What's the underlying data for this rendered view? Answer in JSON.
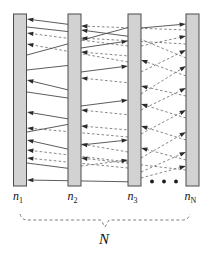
{
  "figure": {
    "background": "#ffffff",
    "bar_fill": "#d2d2d2",
    "bar_stroke": "#4a4a4a",
    "solid_link_color": "#4a4a4a",
    "dashed_link_color": "#6a6a6a",
    "arrow_color": "#2b2b2b",
    "brace_color": "#707070"
  },
  "nodes": [
    {
      "id": "n1",
      "label_base": "n",
      "label_sub": "1",
      "x": 13.5,
      "y": 14.0,
      "w": 13.0,
      "h": 172.0,
      "label_x": 13.0,
      "label_y": 200.0
    },
    {
      "id": "n2",
      "label_base": "n",
      "label_sub": "2",
      "x": 68.0,
      "y": 14.0,
      "w": 13.0,
      "h": 172.0,
      "label_x": 67.5,
      "label_y": 200.0
    },
    {
      "id": "n3",
      "label_base": "n",
      "label_sub": "3",
      "x": 128.0,
      "y": 14.0,
      "w": 13.0,
      "h": 172.0,
      "label_x": 127.5,
      "label_y": 200.0
    },
    {
      "id": "nN",
      "label_base": "n",
      "label_sub": "N",
      "x": 186.0,
      "y": 14.0,
      "w": 13.0,
      "h": 172.0,
      "label_x": 184.5,
      "label_y": 200.0
    }
  ],
  "ellipsis": {
    "name": "ellipsis-dots",
    "dots": [
      {
        "cx": 152.0,
        "cy": 181.5,
        "r": 1.9
      },
      {
        "cx": 164.0,
        "cy": 181.5,
        "r": 1.9
      },
      {
        "cx": 176.0,
        "cy": 181.5,
        "r": 1.9
      }
    ]
  },
  "links": [
    {
      "style": "solid",
      "x1": 81.0,
      "y1": 26.0,
      "x2": 27.0,
      "y2": 19.0,
      "dir": "left"
    },
    {
      "style": "solid",
      "x1": 27.0,
      "y1": 27.0,
      "x2": 81.0,
      "y2": 33.0,
      "dir": "right"
    },
    {
      "style": "dashed",
      "x1": 128.0,
      "y1": 46.0,
      "x2": 27.0,
      "y2": 33.0,
      "dir": "left"
    },
    {
      "style": "dashed",
      "x1": 128.0,
      "y1": 62.0,
      "x2": 27.0,
      "y2": 44.0,
      "dir": "left"
    },
    {
      "style": "solid",
      "x1": 81.0,
      "y1": 93.0,
      "x2": 27.0,
      "y2": 80.0,
      "dir": "left"
    },
    {
      "style": "solid",
      "x1": 27.0,
      "y1": 92.0,
      "x2": 81.0,
      "y2": 100.0,
      "dir": "right"
    },
    {
      "style": "solid",
      "x1": 81.0,
      "y1": 121.0,
      "x2": 27.0,
      "y2": 112.0,
      "dir": "left"
    },
    {
      "style": "dashed",
      "x1": 128.0,
      "y1": 137.0,
      "x2": 27.0,
      "y2": 128.0,
      "dir": "left"
    },
    {
      "style": "solid",
      "x1": 81.0,
      "y1": 152.0,
      "x2": 27.0,
      "y2": 140.0,
      "dir": "left"
    },
    {
      "style": "dashed",
      "x1": 128.0,
      "y1": 162.0,
      "x2": 27.0,
      "y2": 150.0,
      "dir": "left"
    },
    {
      "style": "solid",
      "x1": 27.0,
      "y1": 163.0,
      "x2": 81.0,
      "y2": 170.0,
      "dir": "right"
    },
    {
      "style": "solid",
      "x1": 141.0,
      "y1": 182.0,
      "x2": 27.0,
      "y2": 180.0,
      "dir": "left"
    },
    {
      "style": "solid",
      "x1": 27.0,
      "y1": 55.0,
      "x2": 141.0,
      "y2": 24.0,
      "dir": "right"
    },
    {
      "style": "solid",
      "x1": 141.0,
      "y1": 38.0,
      "x2": 81.0,
      "y2": 30.0,
      "dir": "left"
    },
    {
      "style": "solid",
      "x1": 81.0,
      "y1": 48.0,
      "x2": 128.0,
      "y2": 41.0,
      "dir": "right"
    },
    {
      "style": "dashed",
      "x1": 186.0,
      "y1": 30.0,
      "x2": 81.0,
      "y2": 26.0,
      "dir": "left"
    },
    {
      "style": "dashed",
      "x1": 186.0,
      "y1": 44.0,
      "x2": 81.0,
      "y2": 38.0,
      "dir": "left"
    },
    {
      "style": "dashed",
      "x1": 141.0,
      "y1": 57.0,
      "x2": 81.0,
      "y2": 52.0,
      "dir": "left"
    },
    {
      "style": "solid",
      "x1": 81.0,
      "y1": 72.0,
      "x2": 128.0,
      "y2": 66.0,
      "dir": "right"
    },
    {
      "style": "dashed",
      "x1": 141.0,
      "y1": 84.0,
      "x2": 81.0,
      "y2": 78.0,
      "dir": "left"
    },
    {
      "style": "solid",
      "x1": 81.0,
      "y1": 106.0,
      "x2": 128.0,
      "y2": 100.0,
      "dir": "right"
    },
    {
      "style": "dashed",
      "x1": 141.0,
      "y1": 116.0,
      "x2": 81.0,
      "y2": 110.0,
      "dir": "left"
    },
    {
      "style": "dashed",
      "x1": 141.0,
      "y1": 131.0,
      "x2": 81.0,
      "y2": 126.0,
      "dir": "left"
    },
    {
      "style": "solid",
      "x1": 81.0,
      "y1": 145.0,
      "x2": 128.0,
      "y2": 140.0,
      "dir": "right"
    },
    {
      "style": "dashed",
      "x1": 186.0,
      "y1": 170.0,
      "x2": 81.0,
      "y2": 158.0,
      "dir": "left"
    },
    {
      "style": "dashed",
      "x1": 186.0,
      "y1": 58.0,
      "x2": 128.0,
      "y2": 34.0,
      "dir": "left"
    },
    {
      "style": "solid",
      "x1": 141.0,
      "y1": 28.0,
      "x2": 186.0,
      "y2": 24.0,
      "dir": "right"
    },
    {
      "style": "dashed",
      "x1": 141.0,
      "y1": 46.0,
      "x2": 186.0,
      "y2": 36.0,
      "dir": "right"
    },
    {
      "style": "dashed",
      "x1": 141.0,
      "y1": 72.0,
      "x2": 186.0,
      "y2": 50.0,
      "dir": "right"
    },
    {
      "style": "dashed",
      "x1": 186.0,
      "y1": 76.0,
      "x2": 141.0,
      "y2": 60.0,
      "dir": "left"
    },
    {
      "style": "dashed",
      "x1": 141.0,
      "y1": 94.0,
      "x2": 186.0,
      "y2": 66.0,
      "dir": "right"
    },
    {
      "style": "dashed",
      "x1": 186.0,
      "y1": 96.0,
      "x2": 141.0,
      "y2": 86.0,
      "dir": "left"
    },
    {
      "style": "dashed",
      "x1": 141.0,
      "y1": 110.0,
      "x2": 186.0,
      "y2": 88.0,
      "dir": "right"
    },
    {
      "style": "dashed",
      "x1": 186.0,
      "y1": 118.0,
      "x2": 141.0,
      "y2": 104.0,
      "dir": "left"
    },
    {
      "style": "dashed",
      "x1": 141.0,
      "y1": 134.0,
      "x2": 186.0,
      "y2": 110.0,
      "dir": "right"
    },
    {
      "style": "dashed",
      "x1": 186.0,
      "y1": 140.0,
      "x2": 141.0,
      "y2": 126.0,
      "dir": "left"
    },
    {
      "style": "dashed",
      "x1": 141.0,
      "y1": 158.0,
      "x2": 186.0,
      "y2": 132.0,
      "dir": "right"
    },
    {
      "style": "dashed",
      "x1": 186.0,
      "y1": 160.0,
      "x2": 141.0,
      "y2": 148.0,
      "dir": "left"
    },
    {
      "style": "dashed",
      "x1": 141.0,
      "y1": 172.0,
      "x2": 186.0,
      "y2": 152.0,
      "dir": "right"
    },
    {
      "style": "dashed",
      "x1": 141.0,
      "y1": 178.0,
      "x2": 186.0,
      "y2": 166.0,
      "dir": "right"
    },
    {
      "style": "dashed",
      "x1": 128.0,
      "y1": 152.0,
      "x2": 81.0,
      "y2": 144.0,
      "dir": "left"
    },
    {
      "style": "dashed",
      "x1": 128.0,
      "y1": 168.0,
      "x2": 27.0,
      "y2": 158.0,
      "dir": "left"
    },
    {
      "style": "dashed",
      "x1": 81.0,
      "y1": 166.0,
      "x2": 128.0,
      "y2": 160.0,
      "dir": "right"
    },
    {
      "style": "solid",
      "x1": 27.0,
      "y1": 132.0,
      "x2": 81.0,
      "y2": 122.0,
      "dir": "right"
    },
    {
      "style": "solid",
      "x1": 27.0,
      "y1": 70.0,
      "x2": 81.0,
      "y2": 64.0,
      "dir": "right"
    }
  ],
  "brace": {
    "name": "span-brace",
    "label": "N",
    "label_x": 104.0,
    "label_y": 244.0,
    "left_x": 20.0,
    "right_x": 190.0,
    "top_y": 214.0,
    "line_y": 220.0,
    "mid_x": 105.0,
    "tip_y": 227.0
  }
}
